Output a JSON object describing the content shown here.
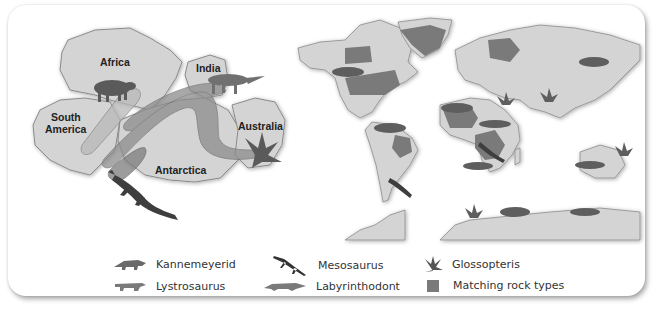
{
  "diagram": {
    "left_panel": {
      "name": "Gondwana reconstruction",
      "continents": [
        {
          "label": "Africa"
        },
        {
          "label": "India"
        },
        {
          "label": "South America"
        },
        {
          "label": "Australia"
        },
        {
          "label": "Antarctica"
        }
      ],
      "south_america_line1": "South",
      "south_america_line2": "America"
    },
    "right_panel": {
      "name": "Present-day world map with fossil locations"
    },
    "legend": {
      "items": [
        {
          "label": "Kannemeyerid",
          "icon": "kannemeyerid-icon"
        },
        {
          "label": "Lystrosaurus",
          "icon": "lystrosaurus-icon"
        },
        {
          "label": "Mesosaurus",
          "icon": "mesosaurus-icon"
        },
        {
          "label": "Labyrinthodont",
          "icon": "labyrinthodont-icon"
        },
        {
          "label": "Glossopteris",
          "icon": "glossopteris-icon"
        },
        {
          "label": "Matching rock types",
          "icon": "rock-swatch-icon"
        }
      ]
    },
    "colors": {
      "land": "#d4d4d4",
      "land_stroke": "#8a8a8a",
      "rock": "#7a7a7a",
      "band_light": "#b8b8b8",
      "band_dark": "#888888",
      "fossil": "#5a5a5a"
    }
  }
}
